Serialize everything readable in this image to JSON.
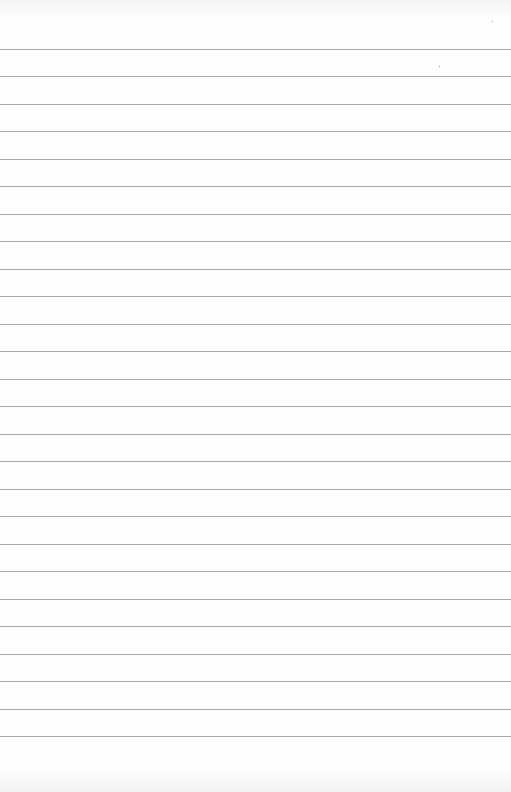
{
  "page": {
    "type": "lined-paper",
    "background": "#fdfdfd",
    "rule_color": "#a9a9a9",
    "first_rule_y": 49,
    "rule_spacing": 27.48,
    "rule_count": 26
  }
}
